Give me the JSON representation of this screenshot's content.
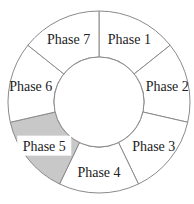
{
  "diagram": {
    "type": "cycle-ring",
    "highlighted_phase": "Phase 5",
    "colors": {
      "default_fill": "#ffffff",
      "highlight_fill": "#c8c8c8",
      "stroke": "#8a8a8a"
    },
    "phases": [
      {
        "label": "Phase 1",
        "highlighted": false
      },
      {
        "label": "Phase 2",
        "highlighted": false
      },
      {
        "label": "Phase 3",
        "highlighted": false
      },
      {
        "label": "Phase 4",
        "highlighted": false
      },
      {
        "label": "Phase 5",
        "highlighted": true
      },
      {
        "label": "Phase 6",
        "highlighted": false
      },
      {
        "label": "Phase 7",
        "highlighted": false
      }
    ]
  }
}
